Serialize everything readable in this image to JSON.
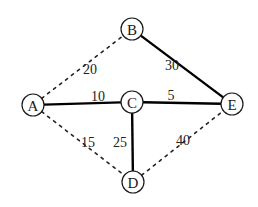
{
  "diagram": {
    "type": "weighted-undirected-graph",
    "nodes": [
      {
        "id": "A",
        "label": "A",
        "x": 33,
        "y": 105
      },
      {
        "id": "B",
        "label": "B",
        "x": 132,
        "y": 29
      },
      {
        "id": "C",
        "label": "C",
        "x": 132,
        "y": 102
      },
      {
        "id": "D",
        "label": "D",
        "x": 133,
        "y": 182
      },
      {
        "id": "E",
        "label": "E",
        "x": 232,
        "y": 104
      }
    ],
    "edges": [
      {
        "from": "A",
        "to": "B",
        "weight": "20",
        "style": "dashed",
        "label_x": 90,
        "label_y": 69
      },
      {
        "from": "A",
        "to": "C",
        "weight": "10",
        "style": "solid",
        "label_x": 98,
        "label_y": 96
      },
      {
        "from": "B",
        "to": "E",
        "weight": "30",
        "style": "solid",
        "label_x": 172,
        "label_y": 65
      },
      {
        "from": "C",
        "to": "E",
        "weight": "5",
        "style": "solid",
        "label_x": 171,
        "label_y": 95
      },
      {
        "from": "A",
        "to": "D",
        "weight": "15",
        "style": "dashed",
        "label_x": 88,
        "label_y": 142
      },
      {
        "from": "C",
        "to": "D",
        "weight": "25",
        "style": "solid",
        "label_x": 120,
        "label_y": 142
      },
      {
        "from": "D",
        "to": "E",
        "weight": "40",
        "style": "dashed",
        "label_x": 183,
        "label_y": 140
      }
    ],
    "node_radius": 11
  }
}
